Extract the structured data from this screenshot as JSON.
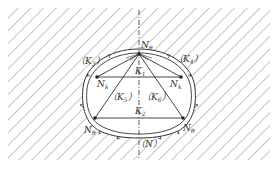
{
  "figure": {
    "type": "tunnel-cross-section-force-diagram",
    "colors": {
      "ink": "#333333",
      "hatch": "#7a7a7a",
      "background": "#ffffff"
    },
    "labels": {
      "apex_node": {
        "base": "N",
        "sub": "θ"
      },
      "upper_left_node": {
        "base": "N",
        "sub": "k"
      },
      "upper_right_node": {
        "base": "N",
        "sub": "k"
      },
      "lower_left_node": {
        "base": "N",
        "sub": "θ"
      },
      "lower_right_node": {
        "base": "N",
        "sub": "θ"
      },
      "k1_left_region": {
        "open": "（",
        "base": "K",
        "sub": "3",
        "close": "）"
      },
      "k4_right_region": {
        "open": "（",
        "base": "K",
        "sub": "4",
        "close": "）"
      },
      "upper_chord": {
        "base": "K",
        "sub": "1"
      },
      "lower_chord": {
        "base": "K",
        "sub": "2"
      },
      "k5_left_inner": {
        "open": "（",
        "base": "K",
        "sub": "5",
        "close": "）"
      },
      "k6_right_inner": {
        "open": "（",
        "base": "K",
        "sub": "6",
        "close": "）"
      },
      "axis_bottom": {
        "open": "（",
        "base": "N",
        "sub": "",
        "close": "）"
      }
    }
  }
}
